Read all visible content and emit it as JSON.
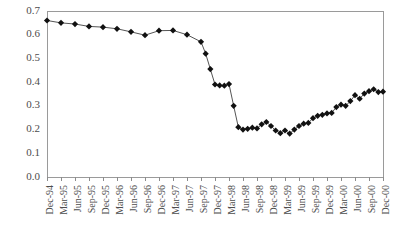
{
  "chart_data": {
    "type": "line",
    "title": "",
    "subtitle": "",
    "xlabel": "",
    "ylabel": "",
    "ylim": [
      0.0,
      0.7
    ],
    "ytick_labels": [
      "0.7",
      "0.6",
      "0.5",
      "0.4",
      "0.3",
      "0.2",
      "0.1",
      "0.0"
    ],
    "ytick_values": [
      0.7,
      0.6,
      0.5,
      0.4,
      0.3,
      0.2,
      0.1,
      0.0
    ],
    "grid": false,
    "legend": null,
    "legend_position": "none",
    "marker_style": "filled-diamond",
    "xtick_labels": [
      "Dec-94",
      "Mar-95",
      "Jun-95",
      "Sep-95",
      "Dec-95",
      "Mar-96",
      "Jun-96",
      "Sep-96",
      "Dec-96",
      "Mar-97",
      "Jun-97",
      "Sep-97",
      "Dec-97",
      "Mar-98",
      "Jun-98",
      "Sep-98",
      "Dec-98",
      "Mar-99",
      "Jun-99",
      "Sep-99",
      "Dec-99",
      "Mar-00",
      "Jun-00",
      "Sep-00",
      "Dec-00"
    ],
    "x": [
      "Dec-94",
      "Mar-95",
      "Jun-95",
      "Sep-95",
      "Dec-95",
      "Mar-96",
      "Jun-96",
      "Sep-96",
      "Dec-96",
      "Mar-97",
      "Jun-97",
      "Sep-97",
      "Oct-97",
      "Nov-97",
      "Dec-97",
      "Jan-98",
      "Feb-98",
      "Mar-98",
      "Apr-98",
      "May-98",
      "Jun-98",
      "Jul-98",
      "Aug-98",
      "Sep-98",
      "Oct-98",
      "Nov-98",
      "Dec-98",
      "Jan-99",
      "Feb-99",
      "Mar-99",
      "Apr-99",
      "May-99",
      "Jun-99",
      "Jul-99",
      "Aug-99",
      "Sep-99",
      "Oct-99",
      "Nov-99",
      "Dec-99",
      "Jan-00",
      "Feb-00",
      "Mar-00",
      "Apr-00",
      "May-00",
      "Jun-00",
      "Jul-00",
      "Aug-00",
      "Sep-00",
      "Oct-00",
      "Nov-00",
      "Dec-00"
    ],
    "values": [
      0.66,
      0.65,
      0.645,
      0.635,
      0.632,
      0.625,
      0.612,
      0.598,
      0.617,
      0.618,
      0.6,
      0.57,
      0.52,
      0.455,
      0.39,
      0.386,
      0.385,
      0.392,
      0.3,
      0.21,
      0.2,
      0.203,
      0.208,
      0.205,
      0.222,
      0.232,
      0.215,
      0.196,
      0.185,
      0.196,
      0.183,
      0.2,
      0.215,
      0.225,
      0.228,
      0.248,
      0.258,
      0.262,
      0.268,
      0.27,
      0.295,
      0.305,
      0.3,
      0.32,
      0.345,
      0.33,
      0.352,
      0.362,
      0.37,
      0.358,
      0.36
    ],
    "axis_color": "#9a9a9a",
    "line_color": "#555555",
    "marker_color": "#111111",
    "background_color": "#ffffff"
  }
}
